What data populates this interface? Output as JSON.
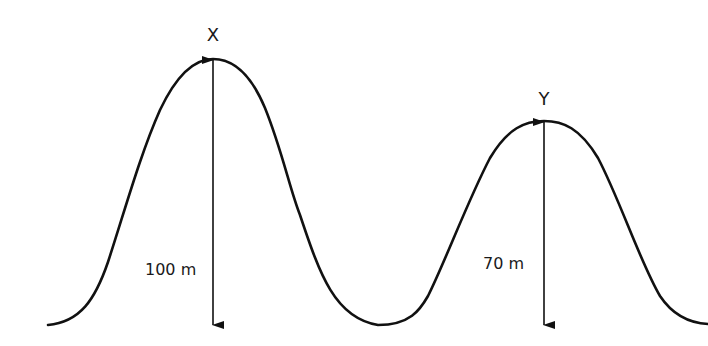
{
  "diagram": {
    "title": "",
    "colors": {
      "line": "#111111",
      "background": "#ffffff",
      "text": "#1a1a1a"
    },
    "peaks": [
      {
        "id": "X",
        "label": "X",
        "height_label": "100 m",
        "height_value": 100,
        "unit": "m"
      },
      {
        "id": "Y",
        "label": "Y",
        "height_label": "70 m",
        "height_value": 70,
        "unit": "m"
      }
    ]
  }
}
